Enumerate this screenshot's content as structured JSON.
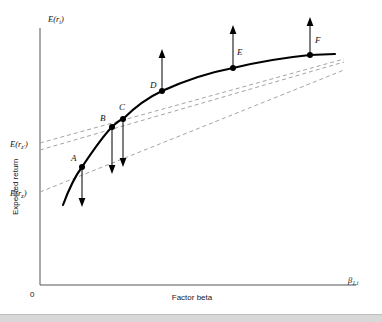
{
  "figure": {
    "axes": {
      "y_axis_top_label": "E(r",
      "y_axis_top_label_sub": "i",
      "y_axis_top_label_close": ")",
      "y_axis_title": "Expected return",
      "x_axis_title": "Factor beta",
      "x_axis_right_label": "β",
      "x_axis_right_label_sub": "1,i",
      "origin_label": "0"
    },
    "intercept_labels": [
      {
        "name": "intercept-upper",
        "text": "E(r",
        "sub": "z'",
        "close": ")",
        "x": 10,
        "y": 147
      },
      {
        "name": "intercept-lower",
        "text": "E(r",
        "sub": "z",
        "close": ")",
        "x": 10,
        "y": 196
      }
    ],
    "points": [
      {
        "label": "A",
        "x": 82,
        "y": 167,
        "arrow": "down",
        "arrow_length": 38,
        "label_dx": -11,
        "label_dy": -6
      },
      {
        "label": "B",
        "x": 112,
        "y": 127,
        "arrow": "down",
        "arrow_length": 47,
        "label_dx": -12,
        "label_dy": -6
      },
      {
        "label": "C",
        "x": 123,
        "y": 119,
        "arrow": "down",
        "arrow_length": 48,
        "label_dx": -4,
        "label_dy": -9
      },
      {
        "label": "D",
        "x": 162,
        "y": 91,
        "arrow": "up",
        "arrow_length": 42,
        "label_dx": -12,
        "label_dy": -3
      },
      {
        "label": "E",
        "x": 233,
        "y": 68,
        "arrow": "up",
        "arrow_length": 43,
        "label_dx": 4,
        "label_dy": -13
      },
      {
        "label": "F",
        "x": 310,
        "y": 55,
        "arrow": "up",
        "arrow_length": 38,
        "label_dx": 5,
        "label_dy": -12
      }
    ],
    "curve": {
      "name": "empirical-return-curve",
      "path": "M 63,205 C 70,186 76,175 82,167 C 92,152 103,136 112,127 C 117,122 120,120 123,119 C 136,106 149,97 162,91 C 186,80 212,72 233,68 C 262,61 290,57 310,55 L 335,54"
    },
    "dashed_lines": [
      {
        "name": "security-market-line-upper",
        "x1": 40,
        "y1": 143,
        "x2": 344,
        "y2": 59
      },
      {
        "name": "security-market-line-middle",
        "x1": 40,
        "y1": 150,
        "x2": 344,
        "y2": 62
      },
      {
        "name": "security-market-line-lower",
        "x1": 40,
        "y1": 192,
        "x2": 344,
        "y2": 70
      }
    ],
    "axis_lines": {
      "y_axis": {
        "x": 40,
        "y_top": 28,
        "y_bottom": 285
      },
      "x_axis": {
        "y": 285,
        "x_left": 40,
        "x_right": 356
      }
    },
    "colors": {
      "curve": "#000000",
      "dashed": "#9a9a9a",
      "axis": "#555555",
      "text": "#1a1a1a",
      "background": "#ffffff",
      "bottom_band": "#d8d8d8"
    }
  }
}
